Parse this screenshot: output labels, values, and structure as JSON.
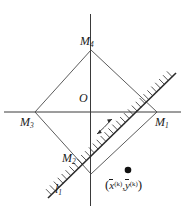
{
  "figure": {
    "background_color": "#ffffff",
    "stroke_color": "#1a1a1a"
  },
  "axes": {
    "origin_label": "O",
    "horizontal_axis_name": "x-axis",
    "vertical_axis_name": "y-axis"
  },
  "vertices": [
    {
      "id": "M1",
      "letter": "M",
      "subscript": "1",
      "position": "right"
    },
    {
      "id": "M2",
      "letter": "M",
      "subscript": "2",
      "position": "bottom"
    },
    {
      "id": "M3",
      "letter": "M",
      "subscript": "3",
      "position": "left"
    },
    {
      "id": "M4",
      "letter": "M",
      "subscript": "4",
      "position": "top"
    }
  ],
  "line": {
    "letter": "l",
    "subscript": "1",
    "style": "hatched",
    "angle_degrees": 45
  },
  "point": {
    "open_paren": "(",
    "x_symbol": "x",
    "x_superscript": "(k)",
    "comma": ",",
    "y_symbol": "y",
    "y_superscript": "(k)",
    "close_paren": ")",
    "marker": "filled-dot"
  },
  "annotations": {
    "rotation_arrow": "double-headed-curved-arrow"
  }
}
